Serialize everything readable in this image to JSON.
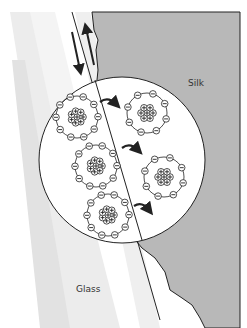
{
  "labels": {
    "silk": "Silk",
    "glass": "Glass"
  },
  "colors": {
    "silk_fill": "#b8b8b8",
    "glass_streak": "#e6e6e6",
    "background": "#ffffff",
    "line": "#222222"
  },
  "atoms": [
    {
      "id": "glass-atom-1",
      "side": "glass",
      "electrons": 10,
      "protons": 8
    },
    {
      "id": "silk-atom-1",
      "side": "silk",
      "electrons": 8,
      "protons": 7
    },
    {
      "id": "glass-atom-2",
      "side": "glass",
      "electrons": 10,
      "protons": 8
    },
    {
      "id": "silk-atom-2",
      "side": "silk",
      "electrons": 8,
      "protons": 7
    },
    {
      "id": "glass-atom-3",
      "side": "glass",
      "electrons": 10,
      "protons": 8
    }
  ],
  "arrows": {
    "rub_direction": [
      "down",
      "up"
    ],
    "electron_transfer_count": 3
  }
}
